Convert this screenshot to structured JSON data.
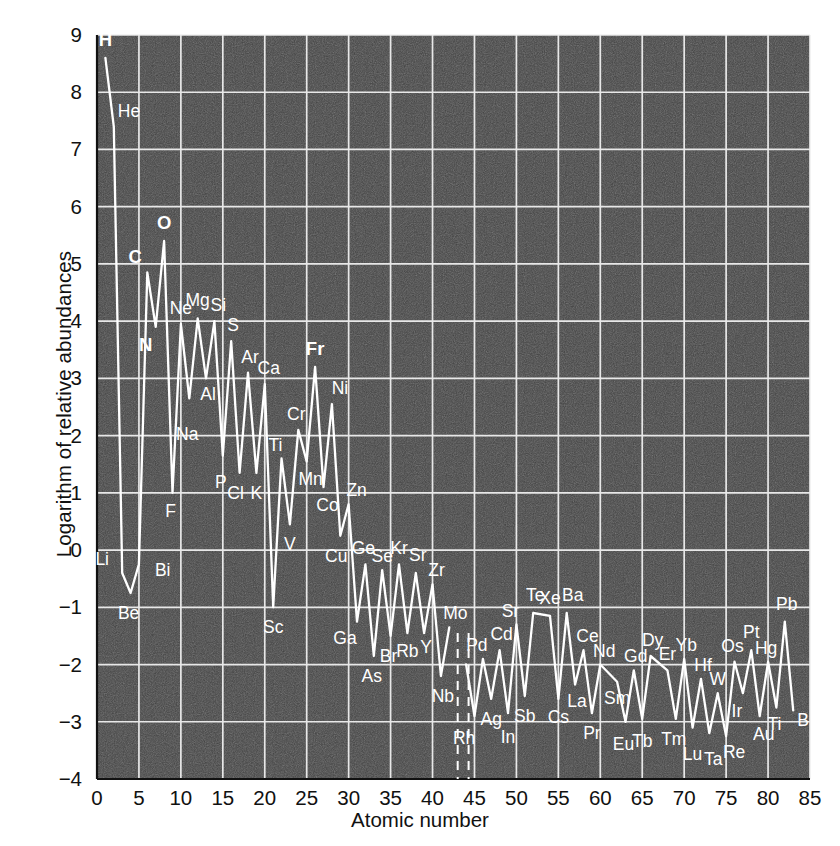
{
  "chart_data": {
    "type": "line",
    "title": "",
    "xlabel": "Atomic number",
    "ylabel": "Logarithm of relative abundances",
    "xlim": [
      0,
      85
    ],
    "ylim": [
      -4,
      9
    ],
    "xticks": [
      0,
      5,
      10,
      15,
      20,
      25,
      30,
      35,
      40,
      45,
      50,
      55,
      60,
      65,
      70,
      75,
      80,
      85
    ],
    "yticks": [
      -4,
      -3,
      -2,
      -1,
      0,
      1,
      2,
      3,
      4,
      5,
      6,
      7,
      8,
      9
    ],
    "grid": true,
    "legend": null,
    "series_name": "Relative abundance of the elements",
    "x": [
      1,
      2,
      3,
      4,
      5,
      6,
      7,
      8,
      9,
      10,
      11,
      12,
      13,
      14,
      15,
      16,
      17,
      18,
      19,
      20,
      21,
      22,
      23,
      24,
      25,
      26,
      27,
      28,
      29,
      30,
      31,
      32,
      33,
      34,
      35,
      36,
      37,
      38,
      39,
      40,
      41,
      42,
      44,
      45,
      46,
      47,
      48,
      49,
      50,
      51,
      52,
      54,
      55,
      56,
      57,
      58,
      59,
      60,
      62,
      63,
      64,
      65,
      66,
      68,
      69,
      70,
      71,
      72,
      73,
      74,
      75,
      76,
      77,
      78,
      79,
      80,
      81,
      82,
      83
    ],
    "y": [
      8.6,
      7.4,
      -0.4,
      -0.75,
      -0.25,
      4.85,
      3.9,
      5.4,
      1.0,
      3.95,
      2.65,
      4.05,
      3.0,
      4.0,
      1.65,
      3.65,
      1.35,
      3.1,
      1.35,
      2.9,
      -1.0,
      1.6,
      0.45,
      2.1,
      1.55,
      3.2,
      1.1,
      2.55,
      0.25,
      0.8,
      -1.25,
      -0.25,
      -1.85,
      -0.35,
      -1.5,
      -0.25,
      -1.45,
      -0.4,
      -1.45,
      -0.6,
      -2.2,
      -1.35,
      -2.0,
      -2.9,
      -1.9,
      -2.6,
      -1.75,
      -2.85,
      -1.3,
      -2.55,
      -1.1,
      -1.15,
      -2.6,
      -1.1,
      -2.35,
      -1.75,
      -2.85,
      -2.0,
      -2.3,
      -3.0,
      -2.1,
      -2.95,
      -1.85,
      -2.1,
      -2.95,
      -1.9,
      -3.1,
      -2.25,
      -3.2,
      -2.5,
      -3.25,
      -1.95,
      -2.5,
      -1.75,
      -2.9,
      -1.95,
      -2.75,
      -1.25,
      -2.8
    ],
    "break_lines": [
      43,
      44.3
    ],
    "series_color": "#ffffff",
    "plot_background": "#424242",
    "grid_color": "#f0f0f0",
    "point_labels": [
      {
        "el": "H",
        "z": 1,
        "v": 8.6,
        "dx": 0,
        "dy": -12,
        "bold": true,
        "anchor": "middle"
      },
      {
        "el": "He",
        "z": 2,
        "v": 7.4,
        "dx": 4,
        "dy": -10,
        "bold": false,
        "anchor": "start"
      },
      {
        "el": "Li",
        "z": 3,
        "v": -0.4,
        "dx": -20,
        "dy": -8,
        "bold": false,
        "anchor": "middle"
      },
      {
        "el": "Be",
        "z": 4,
        "v": -0.75,
        "dx": -2,
        "dy": 26,
        "bold": false,
        "anchor": "middle"
      },
      {
        "el": "Bi",
        "z": 5,
        "v": -0.25,
        "dx": 16,
        "dy": 12,
        "bold": false,
        "anchor": "start"
      },
      {
        "el": "C",
        "z": 6,
        "v": 4.85,
        "dx": -12,
        "dy": -10,
        "bold": true,
        "anchor": "middle"
      },
      {
        "el": "N",
        "z": 7,
        "v": 3.9,
        "dx": -10,
        "dy": 24,
        "bold": true,
        "anchor": "middle"
      },
      {
        "el": "O",
        "z": 8,
        "v": 5.4,
        "dx": 0,
        "dy": -12,
        "bold": true,
        "anchor": "middle"
      },
      {
        "el": "F",
        "z": 9,
        "v": 1.0,
        "dx": -2,
        "dy": 24,
        "bold": false,
        "anchor": "middle"
      },
      {
        "el": "Ne",
        "z": 10,
        "v": 3.95,
        "dx": 0,
        "dy": -10,
        "bold": false,
        "anchor": "middle"
      },
      {
        "el": "Na",
        "z": 11,
        "v": 2.65,
        "dx": -2,
        "dy": 42,
        "bold": false,
        "anchor": "middle"
      },
      {
        "el": "Mg",
        "z": 12,
        "v": 4.05,
        "dx": 0,
        "dy": -12,
        "bold": false,
        "anchor": "middle"
      },
      {
        "el": "Al",
        "z": 13,
        "v": 3.0,
        "dx": 2,
        "dy": 22,
        "bold": false,
        "anchor": "middle"
      },
      {
        "el": "Si",
        "z": 14,
        "v": 4.0,
        "dx": 4,
        "dy": -10,
        "bold": false,
        "anchor": "middle"
      },
      {
        "el": "P",
        "z": 15,
        "v": 1.65,
        "dx": -2,
        "dy": 32,
        "bold": false,
        "anchor": "middle"
      },
      {
        "el": "S",
        "z": 16,
        "v": 3.65,
        "dx": 2,
        "dy": -10,
        "bold": false,
        "anchor": "middle"
      },
      {
        "el": "Cl",
        "z": 17,
        "v": 1.35,
        "dx": -4,
        "dy": 26,
        "bold": false,
        "anchor": "middle"
      },
      {
        "el": "Ar",
        "z": 18,
        "v": 3.1,
        "dx": 2,
        "dy": -10,
        "bold": false,
        "anchor": "middle"
      },
      {
        "el": "K",
        "z": 19,
        "v": 1.35,
        "dx": 0,
        "dy": 26,
        "bold": false,
        "anchor": "middle"
      },
      {
        "el": "Ca",
        "z": 20,
        "v": 2.9,
        "dx": 4,
        "dy": -10,
        "bold": false,
        "anchor": "middle"
      },
      {
        "el": "Sc",
        "z": 21,
        "v": -1.0,
        "dx": 0,
        "dy": 26,
        "bold": false,
        "anchor": "middle"
      },
      {
        "el": "Ti",
        "z": 22,
        "v": 1.6,
        "dx": -6,
        "dy": -8,
        "bold": false,
        "anchor": "middle"
      },
      {
        "el": "V",
        "z": 23,
        "v": 0.45,
        "dx": 0,
        "dy": 26,
        "bold": false,
        "anchor": "middle"
      },
      {
        "el": "Cr",
        "z": 24,
        "v": 2.1,
        "dx": -2,
        "dy": -10,
        "bold": false,
        "anchor": "middle"
      },
      {
        "el": "Mn",
        "z": 25,
        "v": 1.55,
        "dx": 4,
        "dy": 24,
        "bold": false,
        "anchor": "middle"
      },
      {
        "el": "Fr",
        "z": 26,
        "v": 3.2,
        "dx": 0,
        "dy": -12,
        "bold": true,
        "anchor": "middle"
      },
      {
        "el": "Co",
        "z": 27,
        "v": 1.1,
        "dx": 4,
        "dy": 24,
        "bold": false,
        "anchor": "middle"
      },
      {
        "el": "Ni",
        "z": 28,
        "v": 2.55,
        "dx": 8,
        "dy": -10,
        "bold": false,
        "anchor": "middle"
      },
      {
        "el": "Cu",
        "z": 29,
        "v": 0.25,
        "dx": -4,
        "dy": 26,
        "bold": false,
        "anchor": "middle"
      },
      {
        "el": "Zn",
        "z": 30,
        "v": 0.8,
        "dx": 8,
        "dy": -8,
        "bold": false,
        "anchor": "middle"
      },
      {
        "el": "Ga",
        "z": 31,
        "v": -1.25,
        "dx": -12,
        "dy": 22,
        "bold": false,
        "anchor": "middle"
      },
      {
        "el": "Ge",
        "z": 32,
        "v": -0.25,
        "dx": -2,
        "dy": -10,
        "bold": false,
        "anchor": "middle"
      },
      {
        "el": "As",
        "z": 33,
        "v": -1.85,
        "dx": -2,
        "dy": 26,
        "bold": false,
        "anchor": "middle"
      },
      {
        "el": "Se",
        "z": 34,
        "v": -0.35,
        "dx": 0,
        "dy": -8,
        "bold": false,
        "anchor": "middle"
      },
      {
        "el": "Br",
        "z": 35,
        "v": -1.5,
        "dx": -2,
        "dy": 26,
        "bold": false,
        "anchor": "middle"
      },
      {
        "el": "Kr",
        "z": 36,
        "v": -0.25,
        "dx": 0,
        "dy": -10,
        "bold": false,
        "anchor": "middle"
      },
      {
        "el": "Rb",
        "z": 37,
        "v": -1.45,
        "dx": 0,
        "dy": 24,
        "bold": false,
        "anchor": "middle"
      },
      {
        "el": "Sr",
        "z": 38,
        "v": -0.4,
        "dx": 2,
        "dy": -12,
        "bold": false,
        "anchor": "middle"
      },
      {
        "el": "Y",
        "z": 39,
        "v": -1.45,
        "dx": 2,
        "dy": 20,
        "bold": false,
        "anchor": "middle"
      },
      {
        "el": "Zr",
        "z": 40,
        "v": -0.6,
        "dx": 4,
        "dy": -8,
        "bold": false,
        "anchor": "middle"
      },
      {
        "el": "Nb",
        "z": 41,
        "v": -2.2,
        "dx": 2,
        "dy": 26,
        "bold": false,
        "anchor": "middle"
      },
      {
        "el": "Mo",
        "z": 42,
        "v": -1.35,
        "dx": 6,
        "dy": -8,
        "bold": false,
        "anchor": "middle"
      },
      {
        "el": "Rh",
        "z": 44,
        "v": -2.9,
        "dx": -2,
        "dy": 28,
        "bold": false,
        "anchor": "middle"
      },
      {
        "el": "Pd",
        "z": 46,
        "v": -1.9,
        "dx": -6,
        "dy": -8,
        "bold": false,
        "anchor": "middle"
      },
      {
        "el": "Ag",
        "z": 47,
        "v": -2.6,
        "dx": 0,
        "dy": 26,
        "bold": false,
        "anchor": "middle"
      },
      {
        "el": "Cd",
        "z": 48,
        "v": -1.75,
        "dx": 2,
        "dy": -10,
        "bold": false,
        "anchor": "middle"
      },
      {
        "el": "In",
        "z": 49,
        "v": -2.85,
        "dx": 0,
        "dy": 30,
        "bold": false,
        "anchor": "middle"
      },
      {
        "el": "Sr",
        "z": 50,
        "v": -1.3,
        "dx": -6,
        "dy": -8,
        "bold": false,
        "anchor": "middle"
      },
      {
        "el": "Sb",
        "z": 51,
        "v": -2.55,
        "dx": 0,
        "dy": 26,
        "bold": false,
        "anchor": "middle"
      },
      {
        "el": "Te",
        "z": 52,
        "v": -1.1,
        "dx": 2,
        "dy": -12,
        "bold": false,
        "anchor": "middle"
      },
      {
        "el": "Xe",
        "z": 54,
        "v": -1.15,
        "dx": 0,
        "dy": -12,
        "bold": false,
        "anchor": "middle"
      },
      {
        "el": "Cs",
        "z": 55,
        "v": -2.6,
        "dx": 0,
        "dy": 24,
        "bold": false,
        "anchor": "middle"
      },
      {
        "el": "Ba",
        "z": 56,
        "v": -1.1,
        "dx": 6,
        "dy": -12,
        "bold": false,
        "anchor": "middle"
      },
      {
        "el": "La",
        "z": 57,
        "v": -2.35,
        "dx": 2,
        "dy": 22,
        "bold": false,
        "anchor": "middle"
      },
      {
        "el": "Ce",
        "z": 58,
        "v": -1.75,
        "dx": 4,
        "dy": -8,
        "bold": false,
        "anchor": "middle"
      },
      {
        "el": "Pr",
        "z": 59,
        "v": -2.85,
        "dx": 0,
        "dy": 26,
        "bold": false,
        "anchor": "middle"
      },
      {
        "el": "Nd",
        "z": 60,
        "v": -2.0,
        "dx": 4,
        "dy": -8,
        "bold": false,
        "anchor": "middle"
      },
      {
        "el": "Sm",
        "z": 62,
        "v": -2.3,
        "dx": 0,
        "dy": 22,
        "bold": false,
        "anchor": "middle"
      },
      {
        "el": "Eu",
        "z": 63,
        "v": -3.0,
        "dx": -2,
        "dy": 28,
        "bold": false,
        "anchor": "middle"
      },
      {
        "el": "Gd",
        "z": 64,
        "v": -2.1,
        "dx": 2,
        "dy": -8,
        "bold": false,
        "anchor": "middle"
      },
      {
        "el": "Tb",
        "z": 65,
        "v": -2.95,
        "dx": 0,
        "dy": 28,
        "bold": false,
        "anchor": "middle"
      },
      {
        "el": "Dy",
        "z": 66,
        "v": -1.85,
        "dx": 2,
        "dy": -10,
        "bold": false,
        "anchor": "middle"
      },
      {
        "el": "Er",
        "z": 68,
        "v": -2.1,
        "dx": 0,
        "dy": -10,
        "bold": false,
        "anchor": "middle"
      },
      {
        "el": "Tm",
        "z": 69,
        "v": -2.95,
        "dx": -2,
        "dy": 26,
        "bold": false,
        "anchor": "middle"
      },
      {
        "el": "Yb",
        "z": 70,
        "v": -1.9,
        "dx": 2,
        "dy": -8,
        "bold": false,
        "anchor": "middle"
      },
      {
        "el": "Lu",
        "z": 71,
        "v": -3.1,
        "dx": 0,
        "dy": 32,
        "bold": false,
        "anchor": "middle"
      },
      {
        "el": "Hf",
        "z": 72,
        "v": -2.25,
        "dx": 2,
        "dy": -8,
        "bold": false,
        "anchor": "middle"
      },
      {
        "el": "Ta",
        "z": 73,
        "v": -3.2,
        "dx": 4,
        "dy": 32,
        "bold": false,
        "anchor": "middle"
      },
      {
        "el": "W",
        "z": 74,
        "v": -2.5,
        "dx": 0,
        "dy": -8,
        "bold": false,
        "anchor": "middle"
      },
      {
        "el": "Re",
        "z": 75,
        "v": -3.25,
        "dx": 8,
        "dy": 22,
        "bold": false,
        "anchor": "middle"
      },
      {
        "el": "Os",
        "z": 76,
        "v": -1.95,
        "dx": -2,
        "dy": -10,
        "bold": false,
        "anchor": "middle"
      },
      {
        "el": "Ir",
        "z": 77,
        "v": -2.5,
        "dx": -6,
        "dy": 24,
        "bold": false,
        "anchor": "middle"
      },
      {
        "el": "Pt",
        "z": 78,
        "v": -1.75,
        "dx": 0,
        "dy": -12,
        "bold": false,
        "anchor": "middle"
      },
      {
        "el": "Au",
        "z": 79,
        "v": -2.9,
        "dx": 4,
        "dy": 24,
        "bold": false,
        "anchor": "middle"
      },
      {
        "el": "Hg",
        "z": 80,
        "v": -1.95,
        "dx": -2,
        "dy": -8,
        "bold": false,
        "anchor": "middle"
      },
      {
        "el": "Ti",
        "z": 81,
        "v": -2.75,
        "dx": -2,
        "dy": 22,
        "bold": false,
        "anchor": "middle"
      },
      {
        "el": "Pb",
        "z": 82,
        "v": -1.25,
        "dx": 2,
        "dy": -12,
        "bold": false,
        "anchor": "middle"
      },
      {
        "el": "B",
        "z": 83,
        "v": -2.8,
        "dx": 10,
        "dy": 16,
        "bold": false,
        "anchor": "middle"
      }
    ]
  }
}
